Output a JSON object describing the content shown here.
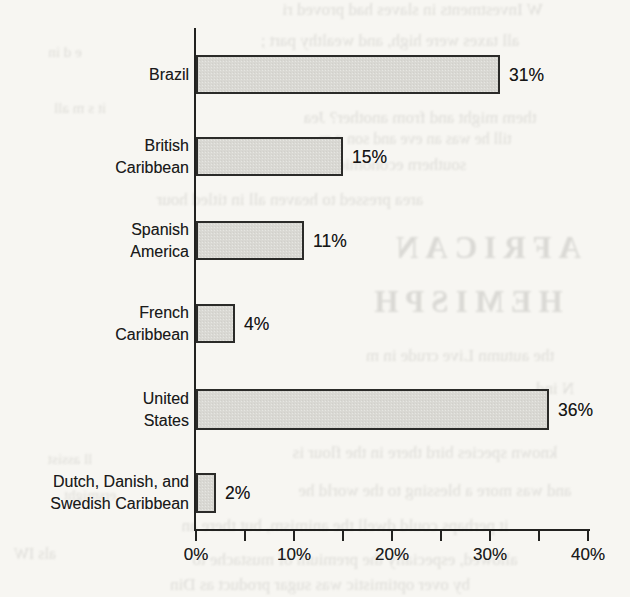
{
  "page": {
    "background_color": "#f7f6f2",
    "kind": "scanned book page with bar graph"
  },
  "chart_data": {
    "type": "bar",
    "orientation": "horizontal",
    "title": "",
    "xlabel": "",
    "ylabel": "",
    "categories": [
      "Brazil",
      "British Caribbean",
      "Spanish America",
      "French Caribbean",
      "United States",
      "Dutch, Danish, and Swedish Caribbean"
    ],
    "category_label_lines": [
      [
        "Brazil"
      ],
      [
        "British",
        "Caribbean"
      ],
      [
        "Spanish",
        "America"
      ],
      [
        "French",
        "Caribbean"
      ],
      [
        "United",
        "States"
      ],
      [
        "Dutch, Danish, and",
        "Swedish Caribbean"
      ]
    ],
    "values": [
      31,
      15,
      11,
      4,
      36,
      2
    ],
    "value_labels": [
      "31%",
      "15%",
      "11%",
      "4%",
      "36%",
      "2%"
    ],
    "x_axis": {
      "range": [
        0,
        40
      ],
      "minor_tick_step_pct": 5,
      "tick_label_values": [
        0,
        10,
        20,
        30,
        40
      ],
      "tick_labels": [
        "0%",
        "10%",
        "20%",
        "30%",
        "40%"
      ]
    },
    "grid": "off",
    "legend": "none",
    "colors": {
      "bar_fill": "#d9d8d3",
      "bar_border": "#2b2b29",
      "axis": "#222220",
      "text": "#1b1b1b",
      "paper": "#f7f6f2"
    }
  },
  "bleed_through": {
    "note": "faint mirrored show-through text from reverse side of the scanned page",
    "lines": [
      {
        "text": "W    Investments in slaves had proved ri",
        "left": 195,
        "top": 0,
        "width": 435,
        "size": 17
      },
      {
        "text": "all taxes were high, and wealthy part ;",
        "left": 150,
        "top": 31,
        "width": 480,
        "size": 17
      },
      {
        "text": "e d   in",
        "left": 0,
        "top": 44,
        "width": 130,
        "size": 15
      },
      {
        "text": "it s m  all",
        "left": 0,
        "top": 100,
        "width": 160,
        "size": 15
      },
      {
        "text": "them might and from another? Jea",
        "left": 210,
        "top": 108,
        "width": 420,
        "size": 17
      },
      {
        "text": "till he was an eve and son g m",
        "left": 250,
        "top": 130,
        "width": 330,
        "size": 16
      },
      {
        "text": "southern economic interests more than",
        "left": 40,
        "top": 155,
        "width": 590,
        "size": 17
      },
      {
        "text": "area pressed to heaven all in titled hour",
        "left": 20,
        "top": 190,
        "width": 540,
        "size": 17
      },
      {
        "text": "AFRICAN",
        "heading": true,
        "left": 340,
        "top": 230,
        "width": 290,
        "size": 31
      },
      {
        "text": "HEMISPH",
        "heading": true,
        "left": 330,
        "top": 284,
        "width": 270,
        "size": 31
      },
      {
        "text": "the autumn Live crude in m",
        "left": 290,
        "top": 346,
        "width": 340,
        "size": 17
      },
      {
        "text": "N ind",
        "left": 480,
        "top": 379,
        "width": 150,
        "size": 17
      },
      {
        "text": "known species bird there in the flour is",
        "left": 220,
        "top": 443,
        "width": 410,
        "size": 17
      },
      {
        "text": "ll  assist",
        "left": 0,
        "top": 451,
        "width": 140,
        "size": 15
      },
      {
        "text": "and was more a blessing to the world he",
        "left": 240,
        "top": 481,
        "width": 390,
        "size": 17
      },
      {
        "text": "ersmight",
        "left": 0,
        "top": 487,
        "width": 180,
        "size": 15
      },
      {
        "text": "it perhaps could dwell the animism, but there an",
        "left": 60,
        "top": 516,
        "width": 570,
        "size": 17
      },
      {
        "text": "als IW",
        "left": 0,
        "top": 545,
        "width": 70,
        "size": 16
      },
      {
        "text": "allowed, especially the premium of mustache to",
        "left": 80,
        "top": 550,
        "width": 550,
        "size": 17
      },
      {
        "text": "by over optimistic was sugar product as Din",
        "left": 40,
        "top": 575,
        "width": 560,
        "size": 17
      }
    ]
  }
}
